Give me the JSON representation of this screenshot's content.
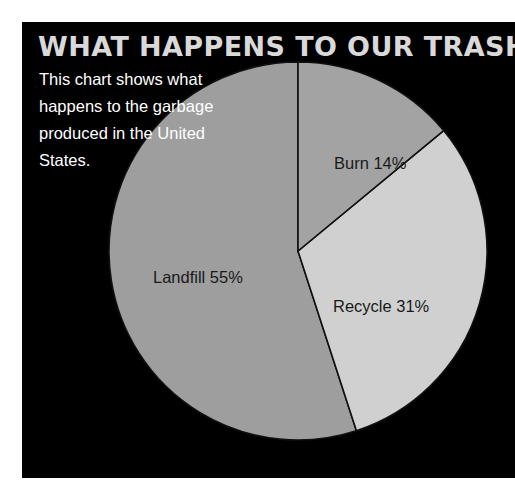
{
  "poster": {
    "title": "WHAT HAPPENS TO OUR TRASH?",
    "description": "This chart shows what happens to the garbage produced in the United States.",
    "background_color": "#000000",
    "title_color": "#d9d9d9",
    "text_color": "#ffffff"
  },
  "chart_data": {
    "type": "pie",
    "title": "WHAT HAPPENS TO OUR TRASH?",
    "subtitle": "This chart shows what happens to the garbage produced in the United States.",
    "xlabel": "",
    "ylabel": "",
    "categories": [
      "Landfill",
      "Recycle",
      "Burn"
    ],
    "values": [
      55,
      31,
      14
    ],
    "unit": "%",
    "total": 100,
    "start_angle_deg": 0,
    "direction": "clockwise",
    "legend": "none",
    "grid": false,
    "slices": [
      {
        "name": "Landfill",
        "label": "Landfill 55%",
        "value": 55,
        "percent": "55%",
        "color": "#9e9e9e",
        "start_deg": 50.4,
        "end_deg": 248.4
      },
      {
        "name": "Recycle",
        "label": "Recycle 31%",
        "value": 31,
        "percent": "31%",
        "color": "#d0d0d0",
        "start_deg": 50.4,
        "end_deg": 162.0
      },
      {
        "name": "Burn",
        "label": "Burn 14%",
        "value": 14,
        "percent": "14%",
        "color": "#a3a3a3",
        "start_deg": 0,
        "end_deg": 50.4
      }
    ],
    "stroke_color": "#101010",
    "center_x": 276,
    "center_y": 229,
    "radius": 189
  }
}
